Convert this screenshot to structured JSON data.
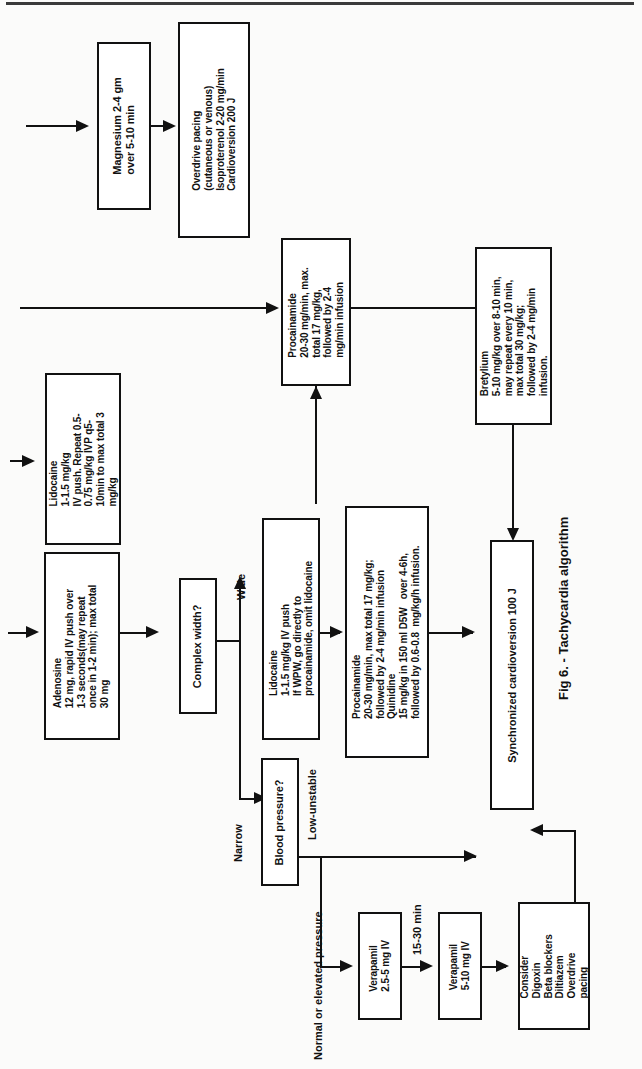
{
  "figure": {
    "caption": "Fig 6. - Tachycardia algorithm",
    "orientation": "landscape-rotated-90ccw",
    "page_rule": true
  },
  "nodes": {
    "magnesium": {
      "label": "Magnesium 2-4 gm\nover 5-10 min"
    },
    "overdrive_pacing": {
      "label": "Overdrive pacing\n(cutaneous or venous)\nIsoproterenol 2-20 mg/min\nCardioversion 200 J"
    },
    "procainamide_top": {
      "label": "Procainamide\n20-30 mg/min, max.\ntotal 17 mg/kg,\nfollowed by 2-4\nmg/min infusion"
    },
    "bretylium": {
      "label": "Bretylium\n5-10 mg/kg over 8-10 min,\nmay repeat every 10 min,\nmax total 30 mg/kg;\nfollowed by 2-4 mg/min\ninfusion."
    },
    "lidocaine_upper": {
      "label": "Lidocaine\n1-1.5 mg/kg\nIV push. Repeat 0.5-\n0.75 mg/kg IVP q5-\n10min to max total 3\nmg/kg"
    },
    "adenosine": {
      "label": "Adenosine\n12 mg, rapid IV push over\n1-3 seconds(may repeat\nonce in 1-2 min); max total\n30 mg"
    },
    "complex_width": {
      "label": "Complex width?"
    },
    "lidocaine_wide": {
      "label": "Lidocaine\n1-1.5 mg/kg IV push\nIf WPW, go directly to\nprocainamide, omit lidocaine"
    },
    "procainamide_quinidine": {
      "label": "Procainamide\n20-30 mg/min, max total 17 mg/kg;\nfollowed by 2-4 mg/min infusion\nQuinidine\n15 mg/kg in 150 ml D5W   over 4-6h,\nfollowed by 0.6-0.8  mg/kg/h infusion."
    },
    "sync_cardioversion": {
      "label": "Synchronized cardioversion 100 J"
    },
    "blood_pressure": {
      "label": "Blood pressure?"
    },
    "verapamil_1": {
      "label": "Verapamil\n2.5-5 mg IV"
    },
    "verapamil_2": {
      "label": "Verapamil\n5-10 mg IV"
    },
    "consider": {
      "label": "Consider\nDigoxin\nBeta blockers\nDiltiazem\nOverdrive\npacing"
    }
  },
  "edge_labels": {
    "wide": "Wide",
    "narrow": "Narrow",
    "low_unstable": "Low-unstable",
    "normal_or_elevated": "Normal or elevated pressure",
    "interval_15_30": "15-30 min"
  },
  "colors": {
    "ink": "#111111",
    "paper": "#fbfbfa",
    "box_fill": "#ffffff"
  }
}
